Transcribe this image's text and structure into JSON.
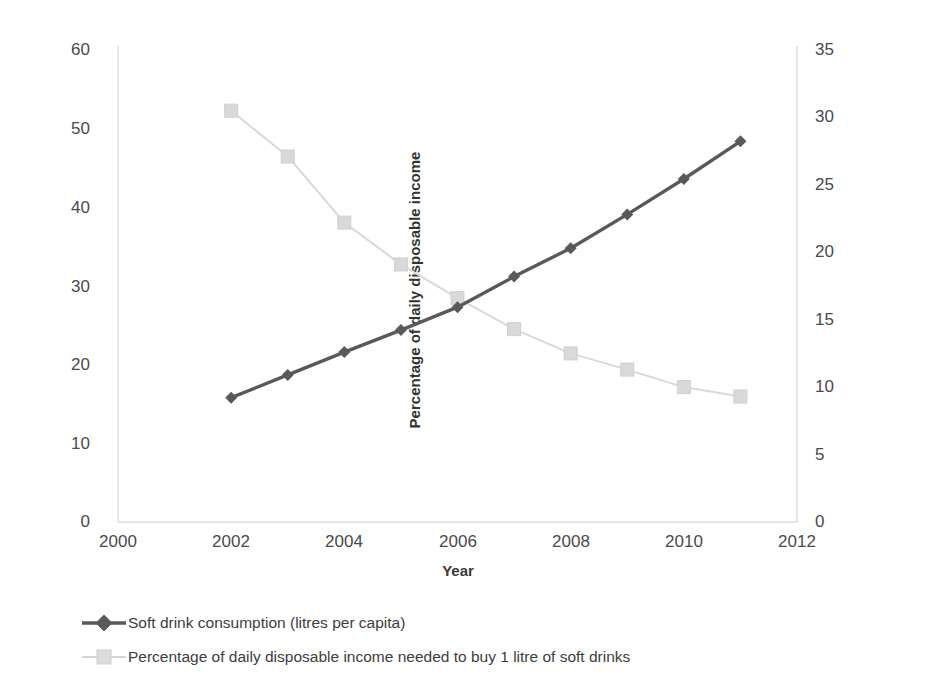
{
  "chart_data": {
    "type": "line",
    "title": "",
    "subtitle": "",
    "xlabel": "Year",
    "x": [
      2002,
      2003,
      2004,
      2005,
      2006,
      2007,
      2008,
      2009,
      2010,
      2011
    ],
    "xlim": [
      2000,
      2012
    ],
    "xticks": [
      "2000",
      "2002",
      "2004",
      "2006",
      "2008",
      "2010",
      "2012"
    ],
    "xtick_values": [
      2000,
      2002,
      2004,
      2006,
      2008,
      2010,
      2012
    ],
    "grid": false,
    "legend_position": "bottom-left",
    "axes": [
      {
        "id": "left",
        "label": "Soft drink consumption (litres per capita)",
        "lim": [
          0,
          60
        ],
        "ticks": [
          "0",
          "10",
          "20",
          "30",
          "40",
          "50",
          "60"
        ],
        "tick_values": [
          0,
          10,
          20,
          30,
          40,
          50,
          60
        ]
      },
      {
        "id": "right",
        "label": "Percentage of daily disposable income",
        "lim": [
          0,
          35
        ],
        "ticks": [
          "0",
          "5",
          "10",
          "15",
          "20",
          "25",
          "30",
          "35"
        ],
        "tick_values": [
          0,
          5,
          10,
          15,
          20,
          25,
          30,
          35
        ]
      }
    ],
    "series": [
      {
        "name": "Soft drink consumption (litres per capita)",
        "axis": "left",
        "color": "#595959",
        "marker": "diamond",
        "values": [
          15.8,
          18.7,
          21.6,
          24.4,
          27.3,
          31.2,
          34.8,
          39.1,
          43.6,
          48.4
        ]
      },
      {
        "name": "Percentage of daily disposable income needed to buy 1 litre of soft drinks",
        "axis": "right",
        "color": "#d9d9d9",
        "marker": "square",
        "values": [
          30.5,
          27.1,
          22.2,
          19.1,
          16.6,
          14.3,
          12.5,
          11.3,
          10.0,
          9.3
        ]
      }
    ]
  },
  "colors": {
    "series_dark": "#595959",
    "series_light": "#d9d9d9",
    "axis_line": "#dadada",
    "text": "#3a3a3a"
  }
}
